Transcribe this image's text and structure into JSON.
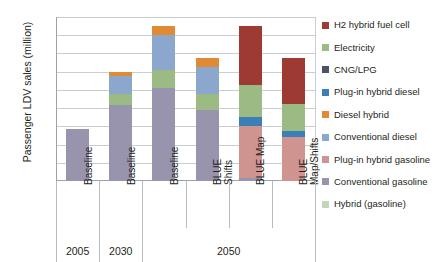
{
  "chart_data": {
    "type": "bar",
    "stacked": true,
    "title": "",
    "xlabel": "",
    "ylabel": "Passenger LDV sales (million)",
    "ylim": [
      0,
      180
    ],
    "ytick_step": 20,
    "yticks": [
      0,
      20,
      40,
      60,
      80,
      100,
      120,
      140,
      160,
      180
    ],
    "grid": true,
    "legend_position": "right",
    "categories": [
      "Baseline",
      "Baseline",
      "Baseline",
      "BLUE\nShifts",
      "BLUE Map",
      "BLUE\nMap/Shifts"
    ],
    "group_labels": [
      "2005",
      "2030",
      "2050"
    ],
    "group_spans": [
      1,
      1,
      4
    ],
    "series": [
      {
        "name": "Hybrid (gasoline)",
        "color": "#c3d6b8",
        "values": [
          0,
          0,
          0,
          0,
          0,
          0
        ]
      },
      {
        "name": "Conventional gasoline",
        "color": "#9894ae",
        "values": [
          57,
          83,
          102,
          78,
          3,
          0
        ]
      },
      {
        "name": "Plug-in hybrid gasoline",
        "color": "#cf9490",
        "values": [
          0,
          0,
          0,
          0,
          57,
          48
        ]
      },
      {
        "name": "Conventional diesel",
        "color": "#8ba7cd",
        "values": [
          0,
          20,
          38,
          30,
          0,
          0
        ]
      },
      {
        "name": "Diesel hybrid",
        "color": "#e08a33",
        "values": [
          0,
          5,
          10,
          10,
          0,
          0
        ]
      },
      {
        "name": "Plug-in hybrid diesel",
        "color": "#3a7fb5",
        "values": [
          0,
          0,
          0,
          0,
          10,
          7
        ]
      },
      {
        "name": "CNG/LPG",
        "color": "#4a5263",
        "values": [
          0,
          0,
          0,
          0,
          0,
          0
        ]
      },
      {
        "name": "Electricity",
        "color": "#9cbb84",
        "values": [
          0,
          12,
          20,
          17,
          35,
          30
        ]
      },
      {
        "name": "H2 hybrid fuel cell",
        "color": "#9e3a34",
        "values": [
          0,
          0,
          0,
          0,
          65,
          50
        ]
      }
    ],
    "bar_stacks": [
      {
        "category": "Baseline",
        "group": "2005",
        "total": 57,
        "segments": [
          {
            "name": "Conventional gasoline",
            "color": "#9894ae",
            "value": 57
          }
        ]
      },
      {
        "category": "Baseline",
        "group": "2030",
        "total": 120,
        "segments": [
          {
            "name": "Conventional gasoline",
            "color": "#9894ae",
            "value": 83
          },
          {
            "name": "Electricity",
            "color": "#9cbb84",
            "value": 12
          },
          {
            "name": "Conventional diesel",
            "color": "#8ba7cd",
            "value": 20
          },
          {
            "name": "Diesel hybrid",
            "color": "#e08a33",
            "value": 5
          }
        ]
      },
      {
        "category": "Baseline",
        "group": "2050",
        "total": 170,
        "segments": [
          {
            "name": "Conventional gasoline",
            "color": "#9894ae",
            "value": 102
          },
          {
            "name": "Electricity",
            "color": "#9cbb84",
            "value": 20
          },
          {
            "name": "Conventional diesel",
            "color": "#8ba7cd",
            "value": 38
          },
          {
            "name": "Diesel hybrid",
            "color": "#e08a33",
            "value": 10
          }
        ]
      },
      {
        "category": "BLUE Shifts",
        "group": "2050",
        "total": 135,
        "segments": [
          {
            "name": "Conventional gasoline",
            "color": "#9894ae",
            "value": 78
          },
          {
            "name": "Electricity",
            "color": "#9cbb84",
            "value": 17
          },
          {
            "name": "Conventional diesel",
            "color": "#8ba7cd",
            "value": 30
          },
          {
            "name": "Diesel hybrid",
            "color": "#e08a33",
            "value": 10
          }
        ]
      },
      {
        "category": "BLUE Map",
        "group": "2050",
        "total": 170,
        "segments": [
          {
            "name": "Conventional gasoline",
            "color": "#9894ae",
            "value": 3
          },
          {
            "name": "Plug-in hybrid gasoline",
            "color": "#cf9490",
            "value": 57
          },
          {
            "name": "Plug-in hybrid diesel",
            "color": "#3a7fb5",
            "value": 10
          },
          {
            "name": "Electricity",
            "color": "#9cbb84",
            "value": 35
          },
          {
            "name": "H2 hybrid fuel cell",
            "color": "#9e3a34",
            "value": 65
          }
        ]
      },
      {
        "category": "BLUE Map/Shifts",
        "group": "2050",
        "total": 135,
        "segments": [
          {
            "name": "Plug-in hybrid gasoline",
            "color": "#cf9490",
            "value": 48
          },
          {
            "name": "Plug-in hybrid diesel",
            "color": "#3a7fb5",
            "value": 7
          },
          {
            "name": "Electricity",
            "color": "#9cbb84",
            "value": 30
          },
          {
            "name": "H2 hybrid fuel cell",
            "color": "#9e3a34",
            "value": 50
          }
        ]
      }
    ],
    "legend": [
      {
        "label": "H2 hybrid fuel cell",
        "color": "#9e3a34"
      },
      {
        "label": "Electricity",
        "color": "#9cbb84"
      },
      {
        "label": "CNG/LPG",
        "color": "#4a5263"
      },
      {
        "label": "Plug-in hybrid diesel",
        "color": "#3a7fb5"
      },
      {
        "label": "Diesel hybrid",
        "color": "#e08a33"
      },
      {
        "label": "Conventional diesel",
        "color": "#8ba7cd"
      },
      {
        "label": "Plug-in hybrid gasoline",
        "color": "#cf9490"
      },
      {
        "label": "Conventional gasoline",
        "color": "#9894ae"
      },
      {
        "label": "Hybrid (gasoline)",
        "color": "#c3d6b8"
      }
    ]
  }
}
